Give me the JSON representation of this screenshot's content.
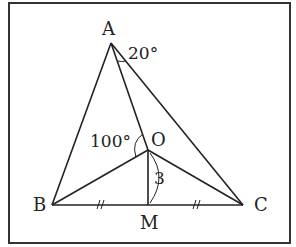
{
  "diagram": {
    "type": "geometry-triangle",
    "frame": {
      "x": 9,
      "y": 3,
      "width": 281,
      "height": 240
    },
    "points": {
      "A": {
        "x": 111,
        "y": 43,
        "label": "A"
      },
      "B": {
        "x": 52,
        "y": 205,
        "label": "B"
      },
      "C": {
        "x": 243,
        "y": 205,
        "label": "C"
      },
      "O": {
        "x": 148,
        "y": 150,
        "label": "O"
      },
      "M": {
        "x": 148,
        "y": 205,
        "label": "M"
      }
    },
    "segments": [
      "AB",
      "AC",
      "BC",
      "AO",
      "BO",
      "CO",
      "OM"
    ],
    "annotations": {
      "angle_OAC": "20°",
      "angle_AOB": "100°",
      "length_OM": "3",
      "equal_marks": "BM = MC"
    }
  }
}
